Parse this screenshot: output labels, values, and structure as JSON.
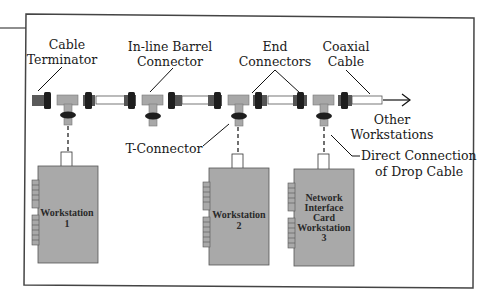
{
  "diagram": {
    "colors": {
      "frame": "#444444",
      "cable": "#ffffff",
      "t_connector": "#a8a8a8",
      "end_connector_dark": "#1e1e1e",
      "end_connector_mid": "#555555",
      "terminator": "#5a5a5a",
      "card": "#a9a9a9",
      "leader_line": "#1a1a1a"
    },
    "labels": {
      "cable_terminator": [
        "Cable",
        "Terminator"
      ],
      "inline_barrel_connector": [
        "In-line Barrel",
        "Connector"
      ],
      "end_connectors": [
        "End",
        "Connectors"
      ],
      "coaxial_cable": [
        "Coaxial",
        "Cable"
      ],
      "other_workstations": [
        "Other",
        "Workstations"
      ],
      "t_connector": "T-Connector",
      "direct_connection": [
        "Direct Connection",
        "of Drop Cable"
      ]
    },
    "workstations": [
      {
        "lines": [
          "Workstation",
          "1"
        ]
      },
      {
        "lines": [
          "Workstation",
          "2"
        ]
      },
      {
        "lines": [
          "Network",
          "Interface",
          "Card",
          "Workstation",
          "3"
        ]
      }
    ]
  }
}
